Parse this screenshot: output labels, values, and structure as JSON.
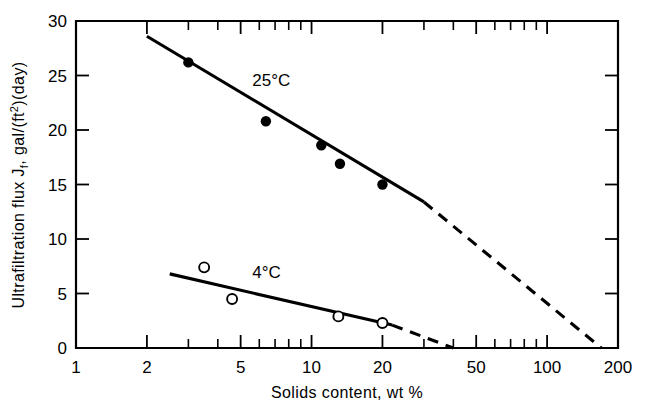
{
  "chart_data": {
    "type": "scatter",
    "title": "",
    "xlabel": "Solids content, wt %",
    "ylabel": "Ultrafiltration flux J₁, gal/(ft²)(day)",
    "ylabel_parts": {
      "prefix": "Ultrafiltration flux J",
      "sub": "f",
      "mid": ", gal/(ft",
      "sup": "2",
      "suffix": ")(day)"
    },
    "xscale": "log",
    "yscale": "linear",
    "xlim": [
      1,
      200
    ],
    "ylim": [
      0,
      30
    ],
    "grid": false,
    "legend": "inline-annotations",
    "xticks_major": [
      1,
      2,
      5,
      10,
      20,
      50,
      100,
      200
    ],
    "xticklabels": [
      "1",
      "2",
      "5",
      "10",
      "20",
      "50",
      "100",
      "200"
    ],
    "xticks_minor": [
      3,
      4,
      6,
      7,
      8,
      9,
      30,
      40,
      60,
      70,
      80,
      90
    ],
    "yticks": [
      0,
      5,
      10,
      15,
      20,
      25,
      30
    ],
    "yticklabels": [
      "0",
      "5",
      "10",
      "15",
      "20",
      "25",
      "30"
    ],
    "series": [
      {
        "name": "25°C",
        "label": "25°C",
        "marker": "filled-circle",
        "annotation": "25°C",
        "points": [
          {
            "x": 3.0,
            "y": 26.2
          },
          {
            "x": 6.4,
            "y": 20.8
          },
          {
            "x": 11.0,
            "y": 18.6
          },
          {
            "x": 13.2,
            "y": 16.9
          },
          {
            "x": 20.0,
            "y": 15.0
          }
        ],
        "fit_solid": {
          "x1": 2.0,
          "y1": 28.6,
          "x2": 30.0,
          "y2": 13.4
        },
        "fit_dashed": {
          "x1": 30.0,
          "y1": 13.4,
          "x2": 170.0,
          "y2": 0.0
        }
      },
      {
        "name": "4°C",
        "label": "4°C",
        "marker": "open-circle",
        "annotation": "4°C",
        "points": [
          {
            "x": 3.5,
            "y": 7.4
          },
          {
            "x": 4.6,
            "y": 4.5
          },
          {
            "x": 13.0,
            "y": 2.9
          },
          {
            "x": 20.0,
            "y": 2.3
          }
        ],
        "fit_solid": {
          "x1": 2.5,
          "y1": 6.8,
          "x2": 22.0,
          "y2": 2.1
        },
        "fit_dashed": {
          "x1": 22.0,
          "y1": 2.1,
          "x2": 40.0,
          "y2": 0.0
        }
      }
    ],
    "annotations": [
      {
        "text": "25°C",
        "x": 5.6,
        "y": 24.0
      },
      {
        "text": "4°C",
        "x": 5.6,
        "y": 6.4
      }
    ]
  }
}
